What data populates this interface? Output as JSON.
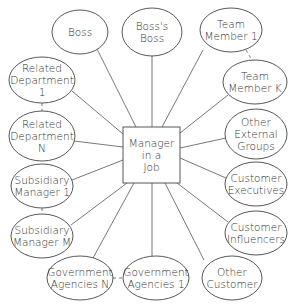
{
  "diagram": {
    "type": "hub-and-spoke",
    "center": {
      "id": "manager",
      "lines": [
        "Manager",
        "in a",
        "Job"
      ],
      "shape": "rectangle",
      "x": 123,
      "y": 127,
      "w": 57,
      "h": 56
    },
    "nodes": [
      {
        "id": "boss",
        "lines": [
          "Boss"
        ],
        "cx": 80,
        "cy": 32,
        "rx": 28,
        "ry": 22
      },
      {
        "id": "bosss-boss",
        "lines": [
          "Boss's",
          "Boss"
        ],
        "cx": 152,
        "cy": 32,
        "rx": 30,
        "ry": 24
      },
      {
        "id": "team-member-1",
        "lines": [
          "Team",
          "Member 1"
        ],
        "cx": 231,
        "cy": 30,
        "rx": 31,
        "ry": 22
      },
      {
        "id": "related-department-1",
        "lines": [
          "Related",
          "Department",
          "1"
        ],
        "cx": 42,
        "cy": 80,
        "rx": 33,
        "ry": 23
      },
      {
        "id": "team-member-k",
        "lines": [
          "Team",
          "Member K"
        ],
        "cx": 255,
        "cy": 82,
        "rx": 32,
        "ry": 22
      },
      {
        "id": "related-department-n",
        "lines": [
          "Related",
          "Department",
          "N"
        ],
        "cx": 42,
        "cy": 136,
        "rx": 33,
        "ry": 25
      },
      {
        "id": "other-external-groups",
        "lines": [
          "Other",
          "External",
          "Groups"
        ],
        "cx": 256,
        "cy": 134,
        "rx": 31,
        "ry": 25
      },
      {
        "id": "subsidiary-manager-1",
        "lines": [
          "Subsidiary",
          "Manager 1"
        ],
        "cx": 42,
        "cy": 186,
        "rx": 31,
        "ry": 22
      },
      {
        "id": "customer-executives",
        "lines": [
          "Customer",
          "Executives"
        ],
        "cx": 256,
        "cy": 184,
        "rx": 31,
        "ry": 22
      },
      {
        "id": "subsidiary-manager-m",
        "lines": [
          "Subsidiary",
          "Manager M"
        ],
        "cx": 42,
        "cy": 236,
        "rx": 31,
        "ry": 22
      },
      {
        "id": "customer-influencers",
        "lines": [
          "Customer",
          "Influencers"
        ],
        "cx": 256,
        "cy": 233,
        "rx": 31,
        "ry": 22
      },
      {
        "id": "government-agencies-n",
        "lines": [
          "Government",
          "Agencies N"
        ],
        "cx": 80,
        "cy": 278,
        "rx": 33,
        "ry": 22
      },
      {
        "id": "government-agencies-1",
        "lines": [
          "Government",
          "Agencies 1"
        ],
        "cx": 156,
        "cy": 278,
        "rx": 33,
        "ry": 22
      },
      {
        "id": "other-customer",
        "lines": [
          "Other",
          "Customer"
        ],
        "cx": 232,
        "cy": 278,
        "rx": 30,
        "ry": 22
      }
    ],
    "edges": [
      {
        "from": "manager",
        "to": "boss",
        "x1": 136,
        "y1": 127,
        "x2": 97,
        "y2": 49
      },
      {
        "from": "manager",
        "to": "bosss-boss",
        "x1": 152,
        "y1": 127,
        "x2": 152,
        "y2": 56
      },
      {
        "from": "manager",
        "to": "team-member-1",
        "x1": 162,
        "y1": 127,
        "x2": 203,
        "y2": 50
      },
      {
        "from": "manager",
        "to": "related-department-1",
        "x1": 123,
        "y1": 134,
        "x2": 72,
        "y2": 91
      },
      {
        "from": "manager",
        "to": "team-member-k",
        "x1": 180,
        "y1": 133,
        "x2": 228,
        "y2": 95
      },
      {
        "from": "manager",
        "to": "related-department-n",
        "x1": 123,
        "y1": 147,
        "x2": 74,
        "y2": 141
      },
      {
        "from": "manager",
        "to": "other-external-groups",
        "x1": 180,
        "y1": 148,
        "x2": 226,
        "y2": 138
      },
      {
        "from": "manager",
        "to": "subsidiary-manager-1",
        "x1": 123,
        "y1": 160,
        "x2": 72,
        "y2": 180
      },
      {
        "from": "manager",
        "to": "customer-executives",
        "x1": 180,
        "y1": 158,
        "x2": 226,
        "y2": 178
      },
      {
        "from": "manager",
        "to": "subsidiary-manager-m",
        "x1": 127,
        "y1": 183,
        "x2": 71,
        "y2": 225
      },
      {
        "from": "manager",
        "to": "customer-influencers",
        "x1": 177,
        "y1": 183,
        "x2": 228,
        "y2": 222
      },
      {
        "from": "manager",
        "to": "government-agencies-n",
        "x1": 134,
        "y1": 183,
        "x2": 93,
        "y2": 258
      },
      {
        "from": "manager",
        "to": "government-agencies-1",
        "x1": 152,
        "y1": 183,
        "x2": 152,
        "y2": 256
      },
      {
        "from": "manager",
        "to": "other-customer",
        "x1": 165,
        "y1": 183,
        "x2": 204,
        "y2": 260
      }
    ],
    "dashed_links": [
      {
        "from": "related-department-1",
        "to": "related-department-n",
        "x1": 42,
        "y1": 103,
        "x2": 42,
        "y2": 111
      },
      {
        "from": "subsidiary-manager-1",
        "to": "subsidiary-manager-m",
        "x1": 42,
        "y1": 208,
        "x2": 42,
        "y2": 214
      },
      {
        "from": "team-member-1",
        "to": "team-member-k",
        "x1": 246,
        "y1": 50,
        "x2": 252,
        "y2": 60
      },
      {
        "from": "government-agencies-n",
        "to": "government-agencies-1",
        "x1": 113,
        "y1": 278,
        "x2": 123,
        "y2": 278
      }
    ],
    "colors": {
      "stroke": "#444444",
      "text": "#333333",
      "background": "#ffffff"
    }
  }
}
